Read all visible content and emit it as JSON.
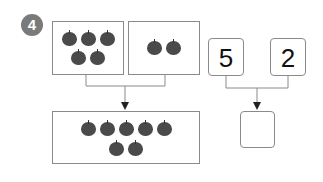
{
  "problem": {
    "number": "4"
  },
  "apple_groups": {
    "left": {
      "count": 5,
      "rows": [
        3,
        2
      ]
    },
    "right": {
      "count": 2,
      "rows": [
        2
      ]
    },
    "combined": {
      "count": 7,
      "rows": [
        5,
        2
      ]
    }
  },
  "number_boxes": {
    "left_value": "5",
    "right_value": "2",
    "answer_value": ""
  },
  "colors": {
    "apple": "#4a4a4a",
    "badge": "#7a7a7a",
    "border": "#8a8a8a"
  }
}
